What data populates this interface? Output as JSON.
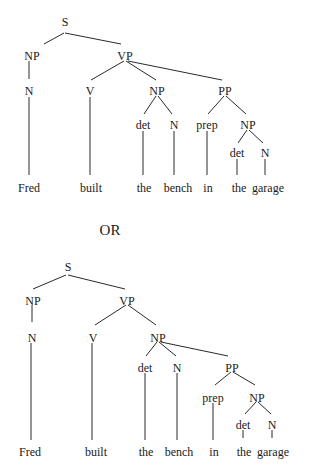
{
  "separator": {
    "label": "OR",
    "x": 110,
    "y": 235
  },
  "trees": [
    {
      "name": "parse-tree-1",
      "nodes": [
        {
          "id": "S",
          "label": "S",
          "x": 65,
          "y": 22
        },
        {
          "id": "NP1",
          "label": "NP",
          "x": 32,
          "y": 56
        },
        {
          "id": "VP",
          "label": "VP",
          "x": 125,
          "y": 56
        },
        {
          "id": "N1",
          "label": "N",
          "x": 29,
          "y": 91
        },
        {
          "id": "V",
          "label": "V",
          "x": 90,
          "y": 91
        },
        {
          "id": "NP2",
          "label": "NP",
          "x": 157,
          "y": 91
        },
        {
          "id": "PP",
          "label": "PP",
          "x": 225,
          "y": 91
        },
        {
          "id": "det1",
          "label": "det",
          "x": 143,
          "y": 125
        },
        {
          "id": "N2",
          "label": "N",
          "x": 174,
          "y": 125
        },
        {
          "id": "prep",
          "label": "prep",
          "x": 207,
          "y": 125
        },
        {
          "id": "NP3",
          "label": "NP",
          "x": 248,
          "y": 125
        },
        {
          "id": "det2",
          "label": "det",
          "x": 237,
          "y": 153
        },
        {
          "id": "N3",
          "label": "N",
          "x": 265,
          "y": 153
        },
        {
          "id": "w1",
          "label": "Fred",
          "x": 29,
          "y": 188,
          "word": true
        },
        {
          "id": "w2",
          "label": "built",
          "x": 91,
          "y": 188,
          "word": true
        },
        {
          "id": "w3",
          "label": "the",
          "x": 144,
          "y": 188,
          "word": true
        },
        {
          "id": "w4",
          "label": "bench",
          "x": 178,
          "y": 188,
          "word": true
        },
        {
          "id": "w5",
          "label": "in",
          "x": 208,
          "y": 188,
          "word": true
        },
        {
          "id": "w6",
          "label": "the",
          "x": 239,
          "y": 188,
          "word": true
        },
        {
          "id": "w7",
          "label": "garage",
          "x": 268,
          "y": 188,
          "word": true
        }
      ],
      "edges": [
        [
          64,
          33,
          44,
          44
        ],
        [
          65,
          33,
          121,
          44
        ],
        [
          29,
          61,
          29,
          79
        ],
        [
          124,
          61,
          91,
          80
        ],
        [
          126,
          61,
          156,
          80
        ],
        [
          128,
          61,
          222,
          80
        ],
        [
          29,
          97,
          29,
          175
        ],
        [
          90,
          97,
          90,
          175
        ],
        [
          156,
          96,
          144,
          114
        ],
        [
          158,
          96,
          172,
          114
        ],
        [
          224,
          96,
          208,
          114
        ],
        [
          226,
          96,
          246,
          114
        ],
        [
          143,
          131,
          143,
          175
        ],
        [
          174,
          131,
          174,
          175
        ],
        [
          207,
          131,
          207,
          175
        ],
        [
          247,
          130,
          238,
          143
        ],
        [
          249,
          130,
          263,
          143
        ],
        [
          237,
          159,
          237,
          175
        ],
        [
          265,
          159,
          265,
          175
        ]
      ]
    },
    {
      "name": "parse-tree-2",
      "nodes": [
        {
          "id": "S",
          "label": "S",
          "x": 68,
          "y": 267
        },
        {
          "id": "NP1",
          "label": "NP",
          "x": 33,
          "y": 301
        },
        {
          "id": "VP",
          "label": "VP",
          "x": 127,
          "y": 301
        },
        {
          "id": "N1",
          "label": "N",
          "x": 32,
          "y": 338
        },
        {
          "id": "V",
          "label": "V",
          "x": 93,
          "y": 338
        },
        {
          "id": "NP2",
          "label": "NP",
          "x": 158,
          "y": 338
        },
        {
          "id": "det1",
          "label": "det",
          "x": 145,
          "y": 368
        },
        {
          "id": "N2",
          "label": "N",
          "x": 177,
          "y": 368
        },
        {
          "id": "PP",
          "label": "PP",
          "x": 232,
          "y": 368
        },
        {
          "id": "prep",
          "label": "prep",
          "x": 213,
          "y": 398
        },
        {
          "id": "NP3",
          "label": "NP",
          "x": 257,
          "y": 398
        },
        {
          "id": "det2",
          "label": "det",
          "x": 243,
          "y": 425
        },
        {
          "id": "N3",
          "label": "N",
          "x": 272,
          "y": 425
        },
        {
          "id": "w1",
          "label": "Fred",
          "x": 30,
          "y": 452,
          "word": true
        },
        {
          "id": "w2",
          "label": "built",
          "x": 96,
          "y": 452,
          "word": true
        },
        {
          "id": "w3",
          "label": "the",
          "x": 146,
          "y": 452,
          "word": true
        },
        {
          "id": "w4",
          "label": "bench",
          "x": 179,
          "y": 452,
          "word": true
        },
        {
          "id": "w5",
          "label": "in",
          "x": 214,
          "y": 452,
          "word": true
        },
        {
          "id": "w6",
          "label": "the",
          "x": 244,
          "y": 452,
          "word": true
        },
        {
          "id": "w7",
          "label": "garage",
          "x": 273,
          "y": 452,
          "word": true
        }
      ],
      "edges": [
        [
          66,
          275,
          33,
          289
        ],
        [
          68,
          275,
          125,
          289
        ],
        [
          32,
          305,
          32,
          322
        ],
        [
          126,
          305,
          95,
          325
        ],
        [
          128,
          305,
          156,
          325
        ],
        [
          31,
          343,
          31,
          440
        ],
        [
          92,
          343,
          92,
          440
        ],
        [
          157,
          342,
          146,
          356
        ],
        [
          159,
          342,
          176,
          356
        ],
        [
          161,
          342,
          228,
          356
        ],
        [
          145,
          373,
          145,
          440
        ],
        [
          177,
          373,
          177,
          440
        ],
        [
          231,
          372,
          215,
          385
        ],
        [
          233,
          372,
          255,
          385
        ],
        [
          213,
          403,
          213,
          440
        ],
        [
          256,
          402,
          245,
          414
        ],
        [
          258,
          402,
          271,
          414
        ],
        [
          243,
          430,
          243,
          438
        ],
        [
          272,
          430,
          272,
          438
        ]
      ]
    }
  ]
}
